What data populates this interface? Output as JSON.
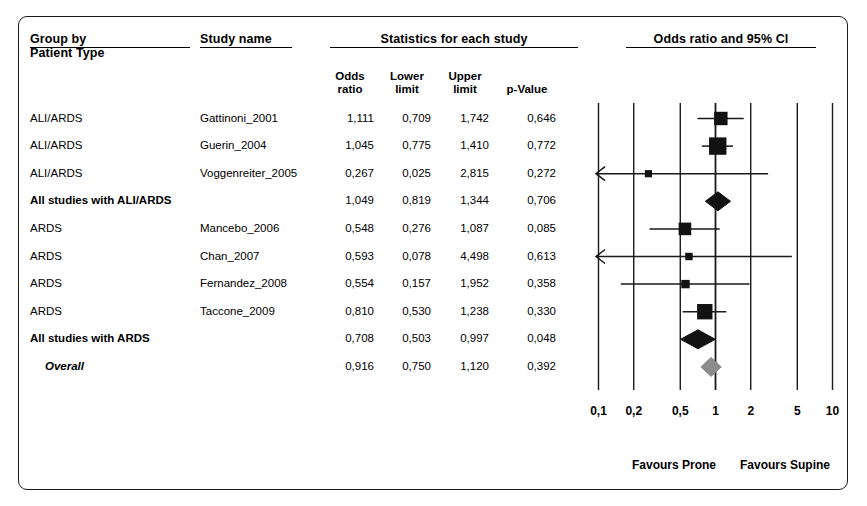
{
  "figure": {
    "headers": {
      "group_by": "Group by",
      "group_by_sub": "Patient Type",
      "study_name": "Study name",
      "statistics": "Statistics for each study",
      "plot_title": "Odds ratio and 95% CI"
    },
    "column_headers": {
      "odds_ratio": [
        "Odds",
        "ratio"
      ],
      "lower_limit": [
        "Lower",
        "limit"
      ],
      "upper_limit": [
        "Upper",
        "limit"
      ],
      "p_value": "p-Value"
    },
    "axis": {
      "ticks": [
        "0,1",
        "0,2",
        "0,5",
        "1",
        "2",
        "5",
        "10"
      ],
      "tick_values": [
        0.1,
        0.2,
        0.5,
        1,
        2,
        5,
        10
      ],
      "scale": "log",
      "favours_left": "Favours Prone",
      "favours_right": "Favours Supine"
    },
    "colors": {
      "marker": "#121212",
      "overall_diamond": "#8c8c8c",
      "line": "#1a1a1a",
      "border": "#1a1a1a"
    }
  },
  "chart_data": {
    "type": "forest",
    "title": "Odds ratio and 95% CI",
    "xlabel": "",
    "ylabel": "",
    "xscale": "log",
    "xlim": [
      0.09,
      11
    ],
    "null_line": 1,
    "grid": true,
    "legend": "none",
    "columns": [
      "Patient Type",
      "Study name",
      "Odds ratio",
      "Lower limit",
      "Upper limit",
      "p-Value"
    ],
    "rows": [
      {
        "group": "ALI/ARDS",
        "study": "Gattinoni_2001",
        "or": "1,111",
        "lower": "0,709",
        "upper": "1,742",
        "p": "0,646",
        "or_v": 1.111,
        "lo_v": 0.709,
        "hi_v": 1.742,
        "p_v": 0.646,
        "kind": "study",
        "weight": 0.62,
        "arrow_left": false,
        "arrow_right": false
      },
      {
        "group": "ALI/ARDS",
        "study": "Guerin_2004",
        "or": "1,045",
        "lower": "0,775",
        "upper": "1,410",
        "p": "0,772",
        "or_v": 1.045,
        "lo_v": 0.775,
        "hi_v": 1.41,
        "p_v": 0.772,
        "kind": "study",
        "weight": 0.95,
        "arrow_left": false,
        "arrow_right": false
      },
      {
        "group": "ALI/ARDS",
        "study": "Voggenreiter_2005",
        "or": "0,267",
        "lower": "0,025",
        "upper": "2,815",
        "p": "0,272",
        "or_v": 0.267,
        "lo_v": 0.025,
        "hi_v": 2.815,
        "p_v": 0.272,
        "kind": "study",
        "weight": 0.1,
        "arrow_left": true,
        "arrow_right": false
      },
      {
        "group": "All studies with ALI/ARDS",
        "study": "",
        "or": "1,049",
        "lower": "0,819",
        "upper": "1,344",
        "p": "0,706",
        "or_v": 1.049,
        "lo_v": 0.819,
        "hi_v": 1.344,
        "p_v": 0.706,
        "kind": "subtotal",
        "weight": 1.0,
        "arrow_left": false,
        "arrow_right": false
      },
      {
        "group": "ARDS",
        "study": "Mancebo_2006",
        "or": "0,548",
        "lower": "0,276",
        "upper": "1,087",
        "p": "0,085",
        "or_v": 0.548,
        "lo_v": 0.276,
        "hi_v": 1.087,
        "p_v": 0.085,
        "kind": "study",
        "weight": 0.55,
        "arrow_left": false,
        "arrow_right": false
      },
      {
        "group": "ARDS",
        "study": "Chan_2007",
        "or": "0,593",
        "lower": "0,078",
        "upper": "4,498",
        "p": "0,613",
        "or_v": 0.593,
        "lo_v": 0.078,
        "hi_v": 4.498,
        "p_v": 0.613,
        "kind": "study",
        "weight": 0.12,
        "arrow_left": true,
        "arrow_right": false
      },
      {
        "group": "ARDS",
        "study": "Fernandez_2008",
        "or": "0,554",
        "lower": "0,157",
        "upper": "1,952",
        "p": "0,358",
        "or_v": 0.554,
        "lo_v": 0.157,
        "hi_v": 1.952,
        "p_v": 0.358,
        "kind": "study",
        "weight": 0.2,
        "arrow_left": false,
        "arrow_right": false
      },
      {
        "group": "ARDS",
        "study": "Taccone_2009",
        "or": "0,810",
        "lower": "0,530",
        "upper": "1,238",
        "p": "0,330",
        "or_v": 0.81,
        "lo_v": 0.53,
        "hi_v": 1.238,
        "p_v": 0.33,
        "kind": "study",
        "weight": 0.78,
        "arrow_left": false,
        "arrow_right": false
      },
      {
        "group": "All studies with  ARDS",
        "study": "",
        "or": "0,708",
        "lower": "0,503",
        "upper": "0,997",
        "p": "0,048",
        "or_v": 0.708,
        "lo_v": 0.503,
        "hi_v": 0.997,
        "p_v": 0.048,
        "kind": "subtotal",
        "weight": 1.0,
        "arrow_left": false,
        "arrow_right": false
      },
      {
        "group": "Overall",
        "study": "",
        "or": "0,916",
        "lower": "0,750",
        "upper": "1,120",
        "p": "0,392",
        "or_v": 0.916,
        "lo_v": 0.75,
        "hi_v": 1.12,
        "p_v": 0.392,
        "kind": "overall",
        "weight": 1.0,
        "arrow_left": false,
        "arrow_right": false
      }
    ]
  }
}
